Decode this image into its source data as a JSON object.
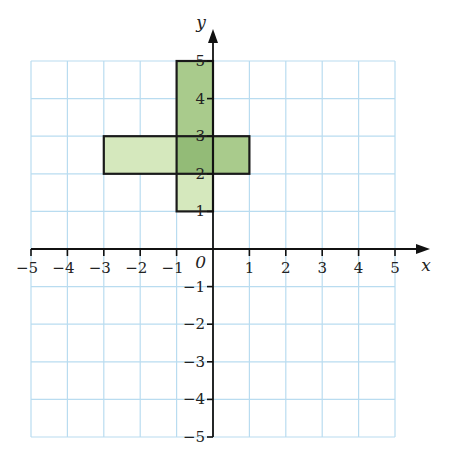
{
  "diagram": {
    "type": "coordinate-grid",
    "axes": {
      "x_label": "x",
      "y_label": "y",
      "origin_label": "0",
      "x_range": [
        -5,
        5
      ],
      "y_range": [
        -5,
        5
      ],
      "x_ticks": [
        "−5",
        "−4",
        "−3",
        "−2",
        "−1",
        "1",
        "2",
        "3",
        "4",
        "5"
      ],
      "y_ticks": [
        "5",
        "4",
        "3",
        "2",
        "1",
        "−1",
        "−2",
        "−3",
        "−4",
        "−5"
      ]
    },
    "colors": {
      "grid": "#b9dcf0",
      "axis": "#111111",
      "outline": "#1a1a1a",
      "light_green": "#d5e8bd",
      "medium_green": "#a9cb8c",
      "overlap_green": "#93bb77"
    },
    "shapes": [
      {
        "name": "vertical-rectangle",
        "x_min": -1,
        "x_max": 0,
        "y_min": 1,
        "y_max": 5,
        "upper_part_fill": "medium_green",
        "lower_part_fill": "light_green"
      },
      {
        "name": "horizontal-rectangle",
        "x_min": -3,
        "x_max": 1,
        "y_min": 2,
        "y_max": 3,
        "left_part_fill": "light_green",
        "right_part_fill": "medium_green"
      }
    ],
    "overlap": {
      "x_min": -1,
      "x_max": 0,
      "y_min": 2,
      "y_max": 3
    }
  }
}
